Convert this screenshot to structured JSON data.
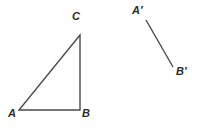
{
  "figure": {
    "title": "",
    "background_color": "#ffffff",
    "stroke_color": "#4a4a4a",
    "label_color": "#2b2b2b",
    "stroke_width": 1.4,
    "width": 198,
    "height": 128
  },
  "labels": {
    "A": "A",
    "B": "B",
    "C": "C",
    "A_prime": "A′",
    "B_prime": "B′"
  },
  "shapes": {
    "triangle": {
      "name": "triangle-ABC",
      "vertices": [
        {
          "label": "A",
          "x": 19,
          "y": 110
        },
        {
          "label": "B",
          "x": 80,
          "y": 110
        },
        {
          "label": "C",
          "x": 80,
          "y": 35
        }
      ],
      "closed": true
    },
    "segment": {
      "name": "segment-A-prime-B-prime",
      "endpoints": [
        {
          "label": "A′",
          "x": 146,
          "y": 20
        },
        {
          "label": "B′",
          "x": 173,
          "y": 67
        }
      ],
      "closed": false
    }
  }
}
